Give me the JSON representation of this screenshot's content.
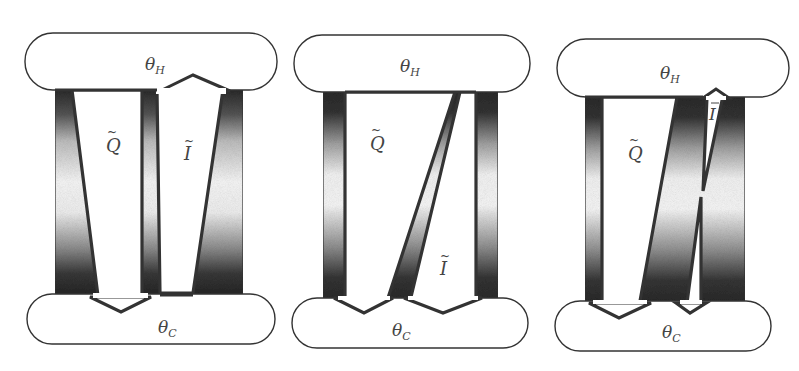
{
  "figure": {
    "panels": [
      {
        "id": "panel-1",
        "hot_label": "θ",
        "hot_sub": "H",
        "cold_label": "θ",
        "cold_sub": "C",
        "q_label": "Q",
        "q_tilde": "~",
        "i_label": "I",
        "i_tilde": "~"
      },
      {
        "id": "panel-2",
        "hot_label": "θ",
        "hot_sub": "H",
        "cold_label": "θ",
        "cold_sub": "C",
        "q_label": "Q",
        "q_tilde": "~",
        "i_label": "I",
        "i_tilde": "~"
      },
      {
        "id": "panel-3",
        "hot_label": "θ",
        "hot_sub": "H",
        "cold_label": "θ",
        "cold_sub": "C",
        "q_label": "Q",
        "q_tilde": "~",
        "i_label": "I",
        "i_tilde": "~"
      }
    ],
    "colors": {
      "stroke": "#333333",
      "band_dark": "#2a2a2a",
      "band_light": "#f4f4f4",
      "background": "#ffffff"
    }
  }
}
